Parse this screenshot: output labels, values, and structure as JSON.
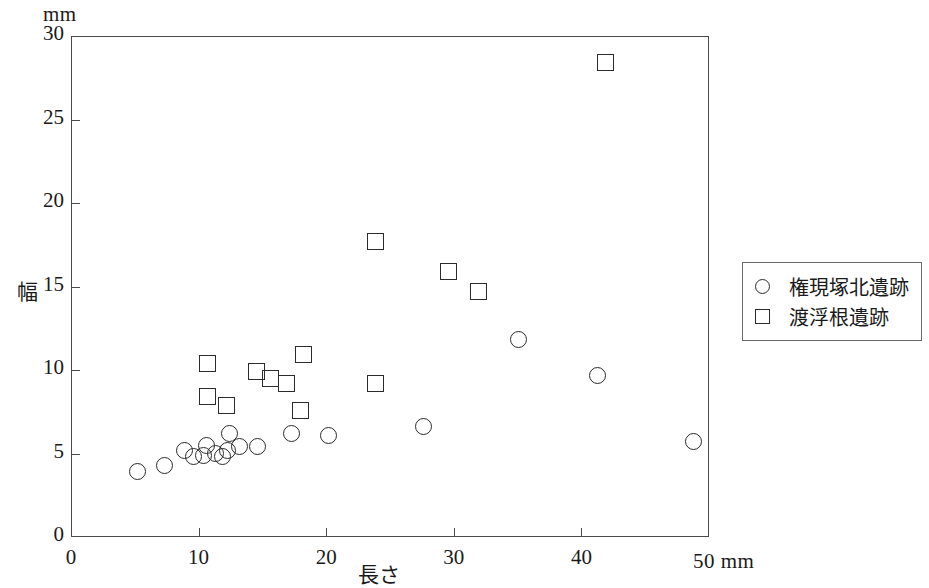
{
  "chart_data": {
    "type": "scatter",
    "title": "",
    "xlabel": "長さ",
    "ylabel": "幅",
    "x_unit_label": "50 mm",
    "y_unit_label": "mm",
    "xlim": [
      0,
      50
    ],
    "ylim": [
      0,
      30
    ],
    "xticks": [
      0,
      10,
      20,
      30,
      40,
      50
    ],
    "xtick_labels": [
      "0",
      "10",
      "20",
      "30",
      "40",
      ""
    ],
    "yticks": [
      0,
      5,
      10,
      15,
      20,
      25,
      30
    ],
    "ytick_labels": [
      "0",
      "5",
      "10",
      "15",
      "20",
      "25",
      "30"
    ],
    "grid": false,
    "legend_position": "right",
    "series": [
      {
        "name": "権現塚北遺跡",
        "marker": "circle",
        "color": "#2b2b2b",
        "points": [
          [
            5.2,
            3.9
          ],
          [
            7.3,
            4.3
          ],
          [
            8.9,
            5.2
          ],
          [
            9.6,
            4.8
          ],
          [
            10.6,
            5.5
          ],
          [
            10.4,
            4.9
          ],
          [
            11.3,
            5.0
          ],
          [
            11.9,
            4.8
          ],
          [
            12.4,
            6.2
          ],
          [
            12.3,
            5.2
          ],
          [
            13.2,
            5.4
          ],
          [
            14.6,
            5.4
          ],
          [
            17.3,
            6.2
          ],
          [
            20.2,
            6.1
          ],
          [
            27.6,
            6.6
          ],
          [
            35.1,
            11.8
          ],
          [
            41.3,
            9.7
          ],
          [
            48.8,
            5.7
          ]
        ]
      },
      {
        "name": "渡浮根遺跡",
        "marker": "square",
        "color": "#2b2b2b",
        "points": [
          [
            10.7,
            10.4
          ],
          [
            10.7,
            8.4
          ],
          [
            12.2,
            7.9
          ],
          [
            14.5,
            9.9
          ],
          [
            15.6,
            9.5
          ],
          [
            16.9,
            9.2
          ],
          [
            18.2,
            10.9
          ],
          [
            18.0,
            7.6
          ],
          [
            23.9,
            17.7
          ],
          [
            23.9,
            9.2
          ],
          [
            29.6,
            15.9
          ],
          [
            31.9,
            14.7
          ],
          [
            41.9,
            28.4
          ]
        ]
      }
    ]
  },
  "legend": {
    "items": [
      {
        "marker": "circle",
        "label": "権現塚北遺跡"
      },
      {
        "marker": "square",
        "label": "渡浮根遺跡"
      }
    ]
  }
}
